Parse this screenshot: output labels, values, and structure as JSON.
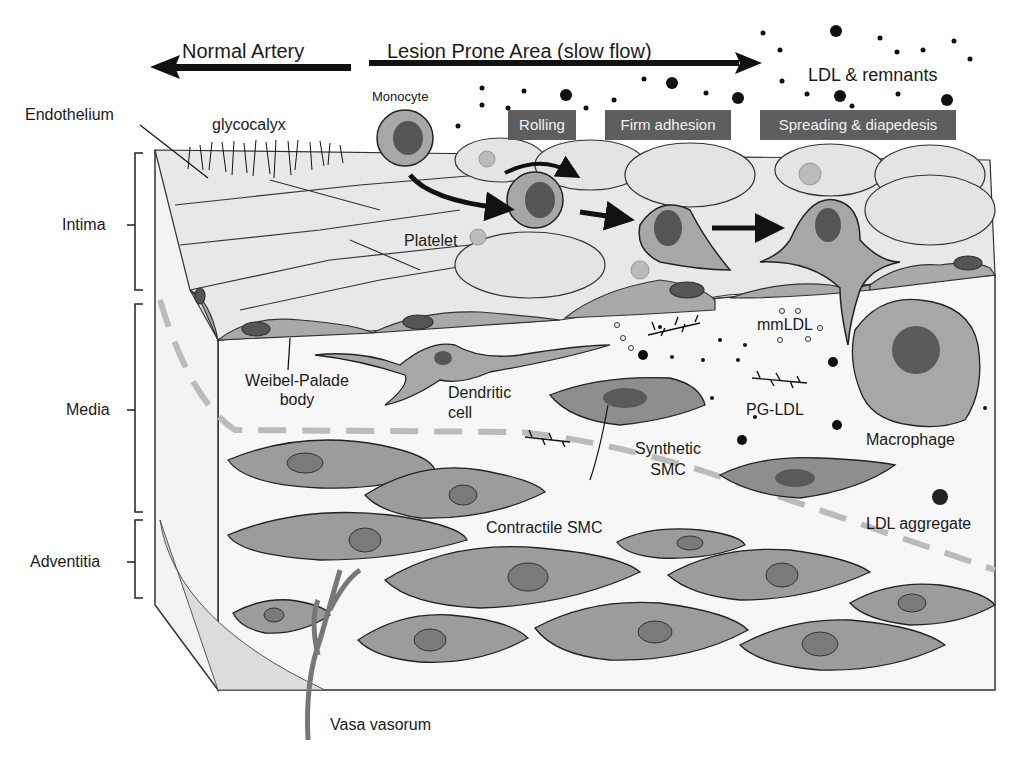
{
  "diagram": {
    "type": "biological-illustration",
    "header": {
      "normal_artery": "Normal Artery",
      "lesion_prone": "Lesion Prone Area (slow flow)",
      "ldl": "LDL & remnants"
    },
    "stages": [
      "Rolling",
      "Firm adhesion",
      "Spreading & diapedesis"
    ],
    "layers": [
      "Intima",
      "Media",
      "Adventitia"
    ],
    "labels": {
      "endothelium": "Endothelium",
      "glycocalyx": "glycocalyx",
      "monocyte": "Monocyte",
      "platelet": "Platelet",
      "weibel_palade_1": "Weibel-Palade",
      "weibel_palade_2": "body",
      "dendritic_1": "Dendritic",
      "dendritic_2": "cell",
      "mmldl": "mmLDL",
      "pg_ldl": "PG-LDL",
      "synthetic_1": "Synthetic",
      "synthetic_2": "SMC",
      "macrophage": "Macrophage",
      "contractile": "Contractile SMC",
      "ldl_aggregate": "LDL aggregate",
      "vasa_vasorum": "Vasa vasorum"
    },
    "colors": {
      "cell_fill": "#e6e6e6",
      "smc_fill": "#9c9c9c",
      "nucleus": "#5a5a5a",
      "tag_bg": "#5e5e5e",
      "outline": "#222222"
    }
  }
}
